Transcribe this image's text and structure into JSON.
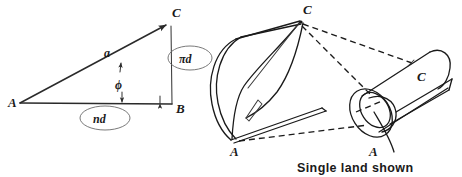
{
  "figure": {
    "background_color": "#ffffff",
    "ink_color": "#1a1a1a",
    "width": 462,
    "height": 177
  },
  "triangle": {
    "name": "helix-development-triangle",
    "vertices": [
      {
        "id": "A",
        "label": "A",
        "role": "left-vertex",
        "x": 18,
        "y": 102
      },
      {
        "id": "B",
        "label": "B",
        "role": "right-angle-vertex",
        "x": 172,
        "y": 104
      },
      {
        "id": "C",
        "label": "C",
        "role": "top-vertex",
        "x": 168,
        "y": 22
      }
    ],
    "sides": [
      {
        "id": "hypotenuse",
        "label": "a",
        "from": "A",
        "to": "C",
        "annotated": true
      },
      {
        "id": "base",
        "label": "nd",
        "from": "A",
        "to": "B",
        "annotated": true,
        "circled": true
      },
      {
        "id": "vertical",
        "label": "πd",
        "from": "B",
        "to": "C",
        "annotated": true,
        "circled": true
      }
    ],
    "angle": {
      "id": "helix-angle",
      "label": "ϕ",
      "at_vertex": "A",
      "between": [
        "base",
        "hypotenuse"
      ]
    }
  },
  "sheet": {
    "name": "unrolled-land-sheet",
    "description": "Flat developed sheet curving into a cylinder",
    "labels": [
      {
        "id": "sheet-C",
        "label": "C",
        "position": "top-right"
      },
      {
        "id": "sheet-A",
        "label": "A",
        "position": "bottom-left"
      }
    ]
  },
  "cylinder": {
    "name": "rolled-barrel-cylinder",
    "description": "Barrel section with a single helical land",
    "labels": [
      {
        "id": "cyl-C",
        "label": "C",
        "position": "upper-right-on-surface"
      },
      {
        "id": "cyl-A",
        "label": "A",
        "position": "below-muzzle-opening"
      }
    ]
  },
  "connectors": {
    "name": "correspondence-dashed-lines",
    "style": "dashed",
    "lines": [
      {
        "id": "C-to-cyl-C-upper",
        "from": "sheet-C",
        "to": "cyl-C"
      },
      {
        "id": "C-to-cyl-A",
        "from": "sheet-C",
        "to": "cyl-A"
      },
      {
        "id": "A-to-cyl-A",
        "from": "sheet-A",
        "to": "cyl-A"
      }
    ]
  },
  "caption": {
    "name": "single-land-caption",
    "text": "Single land shown",
    "has_leader_line": true
  }
}
